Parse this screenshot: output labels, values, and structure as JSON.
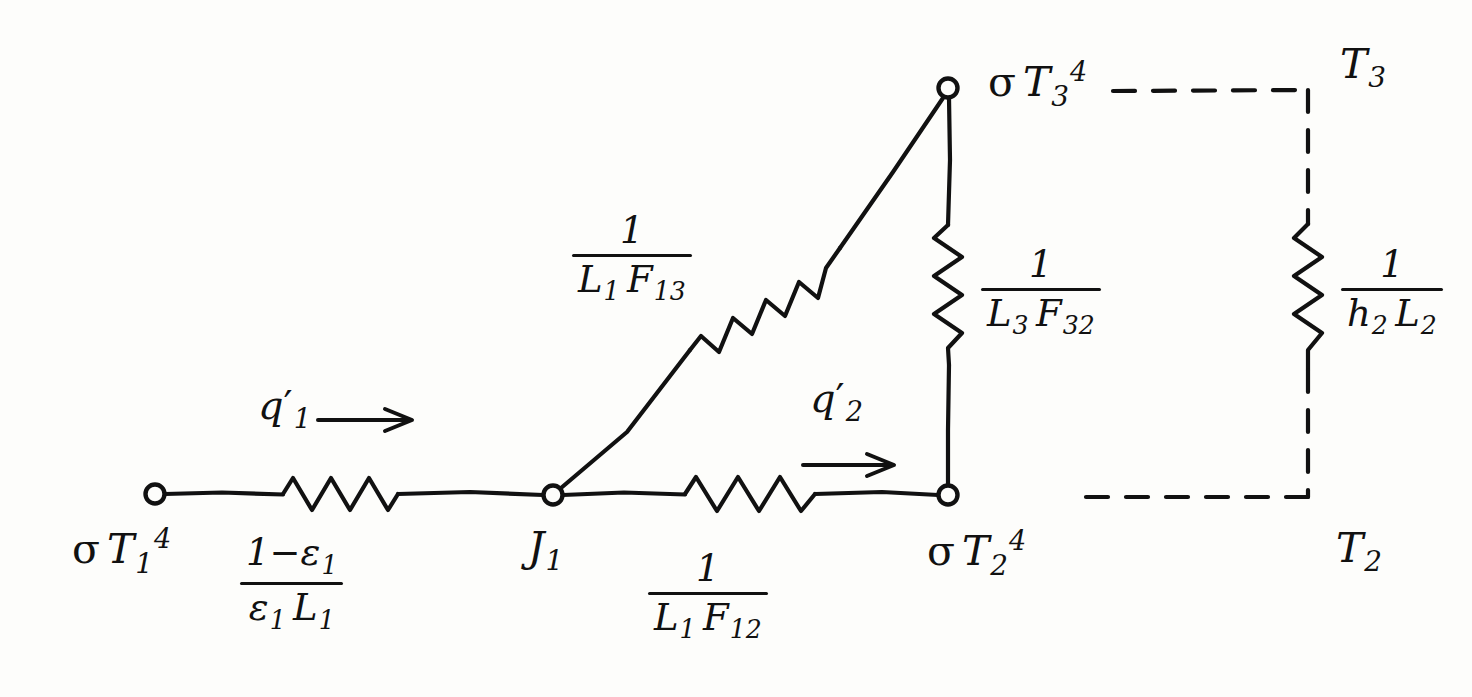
{
  "diagram": {
    "ink_color": "#111111",
    "background": "#fdfdfb"
  },
  "nodes": [
    {
      "id": "n1",
      "label_html": "σ T₁⁴",
      "sigma": "σ",
      "symbol": "T",
      "sub": "1",
      "sup": "4",
      "x": 155,
      "y": 494
    },
    {
      "id": "j1",
      "label_html": "J₁",
      "symbol": "J",
      "sub": "1",
      "sup": "",
      "x": 553,
      "y": 495
    },
    {
      "id": "n2",
      "label_html": "σ T₂⁴",
      "sigma": "σ",
      "symbol": "T",
      "sub": "2",
      "sup": "4",
      "x": 948,
      "y": 495
    },
    {
      "id": "n3",
      "label_html": "σ T₃⁴",
      "sigma": "σ",
      "symbol": "T",
      "sub": "3",
      "sup": "4",
      "x": 948,
      "y": 88
    }
  ],
  "node_labels": {
    "sigma_t1_4": {
      "sigma": "σ",
      "symbol": "T",
      "sub": "1",
      "sup": "4"
    },
    "j1": {
      "symbol": "J",
      "sub": "1"
    },
    "sigma_t2_4": {
      "sigma": "σ",
      "symbol": "T",
      "sub": "2",
      "sup": "4"
    },
    "sigma_t3_4": {
      "sigma": "σ",
      "symbol": "T",
      "sub": "3",
      "sup": "4"
    },
    "t3": {
      "symbol": "T",
      "sub": "3"
    },
    "t2": {
      "symbol": "T",
      "sub": "2"
    }
  },
  "resistors": [
    {
      "id": "r-surface-1",
      "numerator": "1−ε₁",
      "denominator": "ε₁ L₁",
      "num_parts": {
        "text": "1−",
        "symbol": "ε",
        "sub": "1"
      },
      "den_parts": {
        "symbol1": "ε",
        "sub1": "1",
        "symbol2": "L",
        "sub2": "1"
      },
      "orientation": "horizontal",
      "label_x": 272,
      "label_y": 540
    },
    {
      "id": "r-space-12",
      "numerator": "1",
      "denominator": "L₁ F₁₂",
      "num_parts": {
        "text": "1"
      },
      "den_parts": {
        "symbol1": "L",
        "sub1": "1",
        "symbol2": "F",
        "sub2": "12"
      },
      "orientation": "horizontal",
      "label_x": 676,
      "label_y": 556
    },
    {
      "id": "r-space-13",
      "numerator": "1",
      "denominator": "L₁ F₁₃",
      "num_parts": {
        "text": "1"
      },
      "den_parts": {
        "symbol1": "L",
        "sub1": "1",
        "symbol2": "F",
        "sub2": "13"
      },
      "orientation": "diagonal",
      "label_x": 600,
      "label_y": 218
    },
    {
      "id": "r-space-32",
      "numerator": "1",
      "denominator": "L₃ F₃₂",
      "num_parts": {
        "text": "1"
      },
      "den_parts": {
        "symbol1": "L",
        "sub1": "3",
        "symbol2": "F",
        "sub2": "32"
      },
      "orientation": "vertical",
      "label_x": 981,
      "label_y": 252
    },
    {
      "id": "r-convection-2",
      "numerator": "1",
      "denominator": "h₂ L₂",
      "num_parts": {
        "text": "1"
      },
      "den_parts": {
        "symbol1": "h",
        "sub1": "2",
        "symbol2": "L",
        "sub2": "2"
      },
      "orientation": "vertical-dashed",
      "label_x": 1341,
      "label_y": 252
    }
  ],
  "flows": [
    {
      "id": "q1",
      "symbol": "q",
      "prime": "′",
      "sub": "1",
      "label_x": 258,
      "label_y": 385,
      "arrow": "→"
    },
    {
      "id": "q2",
      "symbol": "q",
      "prime": "′",
      "sub": "2",
      "label_x": 810,
      "label_y": 378,
      "arrow": "→"
    }
  ],
  "temperatures": [
    {
      "id": "t3-label",
      "symbol": "T",
      "sub": "3",
      "x": 1340,
      "y": 44
    },
    {
      "id": "t2-label",
      "symbol": "T",
      "sub": "2",
      "x": 1336,
      "y": 528
    }
  ],
  "geometry": {
    "baseline_y": 494,
    "top_y": 88,
    "left_node_x": 155,
    "j1_x": 553,
    "right_node_x": 948,
    "dashed_branch_x": 1308
  }
}
